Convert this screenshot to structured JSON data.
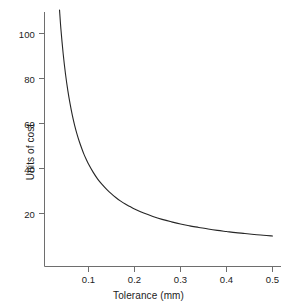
{
  "chart_data": {
    "type": "line",
    "title": "",
    "xlabel": "Tolerance (mm)",
    "ylabel": "Units of cost",
    "xlim": [
      0.02,
      0.53
    ],
    "ylim": [
      5,
      112
    ],
    "grid": false,
    "legend": null,
    "xticks": [
      "0.1",
      "0.2",
      "0.3",
      "0.4",
      "0.5"
    ],
    "xtick_values": [
      0.1,
      0.2,
      0.3,
      0.4,
      0.5
    ],
    "yticks": [
      "20",
      "40",
      "60",
      "80",
      "100"
    ],
    "ytick_values": [
      20,
      40,
      60,
      80,
      100
    ],
    "series": [
      {
        "name": "Cost of manufacture",
        "x": [
          0.025,
          0.03,
          0.035,
          0.04,
          0.045,
          0.05,
          0.055,
          0.06,
          0.065,
          0.07,
          0.075,
          0.08,
          0.085,
          0.09,
          0.095,
          0.1,
          0.11,
          0.12,
          0.13,
          0.14,
          0.15,
          0.16,
          0.17,
          0.18,
          0.19,
          0.2,
          0.22,
          0.24,
          0.26,
          0.28,
          0.3,
          0.32,
          0.34,
          0.36,
          0.38,
          0.4,
          0.42,
          0.44,
          0.46,
          0.48,
          0.5,
          0.52
        ],
        "values": [
          162,
          135.3,
          116.3,
          102,
          90.9,
          82,
          74.7,
          68.7,
          63.5,
          59.1,
          55.3,
          52,
          49.1,
          46.4,
          44.1,
          42,
          38.4,
          35.3,
          32.8,
          30.6,
          28.7,
          27,
          25.5,
          24.2,
          23.1,
          22,
          20.2,
          18.7,
          17.4,
          16.3,
          15.3,
          14.5,
          13.8,
          13.1,
          12.5,
          12,
          11.5,
          11.1,
          10.7,
          10.3,
          10,
          9.7
        ],
        "formula": "cost = 4 / tolerance + 2",
        "color": "#262626"
      }
    ],
    "axis_color": "#6e6e6e",
    "curve_color": "#262626"
  },
  "axes": {
    "x_title": "Tolerance (mm)",
    "y_title": "Units of cost",
    "x_tick_labels": [
      "0.1",
      "0.2",
      "0.3",
      "0.4",
      "0.5"
    ],
    "y_tick_labels": [
      "20",
      "40",
      "60",
      "80",
      "100"
    ]
  }
}
